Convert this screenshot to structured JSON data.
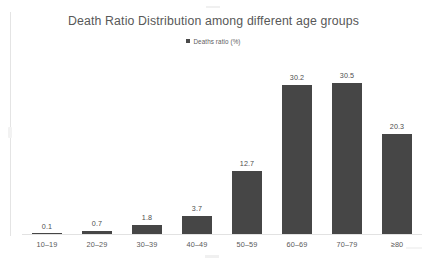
{
  "chart_data": {
    "type": "bar",
    "title": "Death Ratio Distribution among different age groups",
    "xlabel": "",
    "ylabel": "",
    "categories": [
      "10–19",
      "20–29",
      "30–39",
      "40–49",
      "50–59",
      "60–69",
      "70–79",
      "≥80"
    ],
    "values": [
      0.1,
      0.7,
      1.8,
      3.7,
      12.7,
      30.2,
      30.5,
      20.3
    ],
    "value_labels": [
      "0.1",
      "0.7",
      "1.8",
      "3.7",
      "12.7",
      "30.2",
      "30.5",
      "20.3"
    ],
    "series": [
      {
        "name": "Deaths ratio (%)",
        "values": [
          0.1,
          0.7,
          1.8,
          3.7,
          12.7,
          30.2,
          30.5,
          20.3
        ],
        "color": "#464646"
      }
    ],
    "ylim": [
      0,
      36
    ],
    "grid": false,
    "legend": {
      "position": "top",
      "entries": [
        {
          "label": "Deaths ratio (%)",
          "color": "#464646"
        }
      ]
    },
    "axis_color": "#e2e2e2",
    "data_labels_shown": true
  }
}
